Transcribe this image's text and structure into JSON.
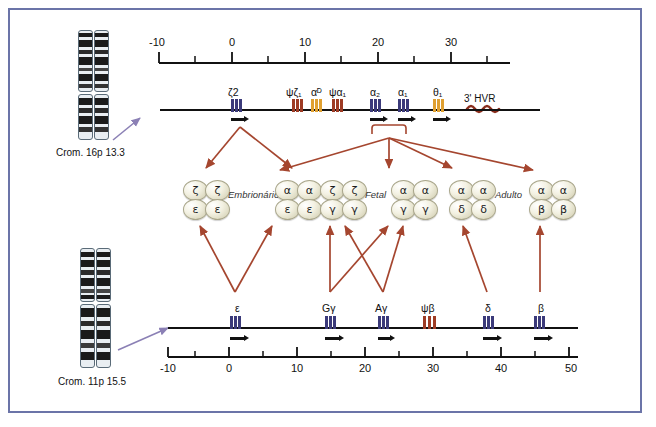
{
  "figure": {
    "title_alpha_cluster": "Crom. 16p 13.3",
    "title_beta_cluster": "Crom. 11p 15.5",
    "hvr_label": "3' HVR",
    "arrow_color": "#a5462f",
    "exon_colors": {
      "purple": "#3b3a7a",
      "orange": "#e0a030",
      "red": "#9e3b24"
    },
    "border_color": "#6b74a8"
  },
  "alpha_axis": {
    "ticks": [
      "-10",
      "0",
      "10",
      "20",
      "30"
    ],
    "tick_values": [
      -10,
      0,
      10,
      20,
      30
    ],
    "min": -12,
    "max": 36
  },
  "beta_axis": {
    "ticks": [
      "-10",
      "0",
      "10",
      "20",
      "30",
      "40",
      "50"
    ],
    "tick_values": [
      -10,
      0,
      10,
      20,
      30,
      40,
      50
    ],
    "min": -12,
    "max": 51
  },
  "alpha_genes": [
    {
      "label": "ζ2",
      "sub": "",
      "kb": 1.5,
      "color": "purple",
      "arrow": true
    },
    {
      "label": "ψζ₁",
      "sub": "",
      "kb": 10.2,
      "color": "red",
      "arrow": false
    },
    {
      "label": "αᴰ",
      "sub": "",
      "kb": 13.0,
      "color": "orange",
      "arrow": false
    },
    {
      "label": "ψα₁",
      "sub": "",
      "kb": 15.8,
      "color": "red",
      "arrow": false
    },
    {
      "label": "α₂",
      "sub": "",
      "kb": 21.5,
      "color": "purple",
      "arrow": true
    },
    {
      "label": "α₁",
      "sub": "",
      "kb": 25.0,
      "color": "purple",
      "arrow": true
    },
    {
      "label": "θ₁",
      "sub": "",
      "kb": 30.2,
      "color": "orange",
      "arrow": true
    }
  ],
  "beta_genes": [
    {
      "label": "ε",
      "kb": 1.5,
      "color": "purple",
      "arrow": true
    },
    {
      "label": "Gγ",
      "kb": 13.5,
      "color": "purple",
      "arrow": true
    },
    {
      "label": "Aγ",
      "kb": 19.0,
      "color": "purple",
      "arrow": true
    },
    {
      "label": "ψβ",
      "kb": 25.0,
      "color": "red",
      "arrow": false
    },
    {
      "label": "δ",
      "kb": 36.5,
      "color": "purple",
      "arrow": true
    },
    {
      "label": "β",
      "kb": 43.5,
      "color": "purple",
      "arrow": true
    }
  ],
  "hemoglobins": [
    {
      "stage": "Embrionário",
      "top": [
        "ζ",
        "ζ"
      ],
      "bottom": [
        "ε",
        "ε"
      ]
    },
    {
      "stage": "",
      "top": [
        "α",
        "α"
      ],
      "bottom": [
        "ε",
        "ε"
      ]
    },
    {
      "stage": "Fetal",
      "top": [
        "ζ",
        "ζ"
      ],
      "bottom": [
        "γ",
        "γ"
      ]
    },
    {
      "stage": "",
      "top": [
        "α",
        "α"
      ],
      "bottom": [
        "γ",
        "γ"
      ]
    },
    {
      "stage": "Adulto",
      "top": [
        "α",
        "α"
      ],
      "bottom": [
        "δ",
        "δ"
      ]
    },
    {
      "stage": "",
      "top": [
        "α",
        "α"
      ],
      "bottom": [
        "β",
        "β"
      ]
    }
  ],
  "stage_labels": {
    "embryonic": "Embrionário",
    "fetal": "Fetal",
    "adult": "Adulto"
  }
}
